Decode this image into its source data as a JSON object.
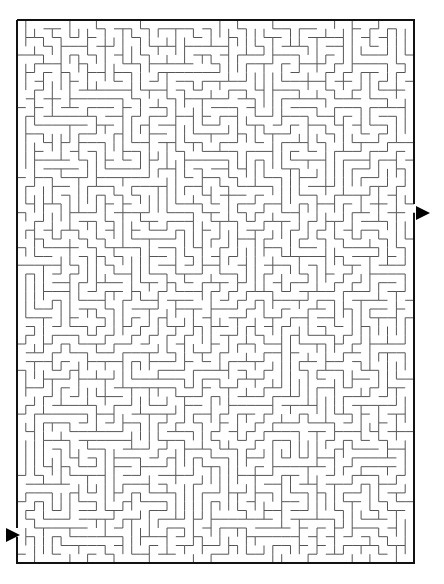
{
  "puzzle": {
    "type": "rectangular-maze",
    "grid": {
      "cols": 45,
      "rows": 62
    },
    "bounds": {
      "left": 17,
      "top": 20,
      "right": 414,
      "bottom": 563
    },
    "wall_color": "#555555",
    "border_color": "#111111",
    "seed": 7349
  },
  "entrances": [
    {
      "name": "right-opening",
      "side": "right",
      "row": 21,
      "arrow": {
        "x": 416,
        "y": 206
      }
    },
    {
      "name": "left-opening",
      "side": "left",
      "row": 58,
      "arrow": {
        "x": 6,
        "y": 528
      }
    }
  ]
}
